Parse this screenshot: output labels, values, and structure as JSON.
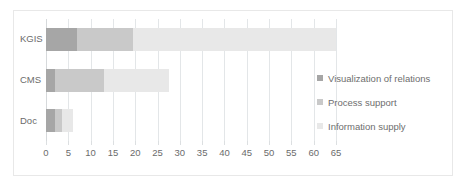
{
  "chart_data": {
    "type": "bar",
    "orientation": "horizontal",
    "stacked": true,
    "title": "",
    "xlabel": "",
    "ylabel": "",
    "categories": [
      "KGIS",
      "CMS",
      "Doc"
    ],
    "series": [
      {
        "name": "Visualization of relations",
        "color": "#a6a6a6",
        "values": [
          7,
          2,
          2
        ]
      },
      {
        "name": "Process support",
        "color": "#c9c9c9",
        "values": [
          12.5,
          11,
          1.5
        ]
      },
      {
        "name": "Information supply",
        "color": "#e8e8e8",
        "values": [
          45.5,
          14.5,
          2.5
        ]
      }
    ],
    "totals": [
      65,
      27.5,
      6
    ],
    "xlim": [
      0,
      65
    ],
    "xticks": [
      0,
      5,
      10,
      15,
      20,
      25,
      30,
      35,
      40,
      45,
      50,
      55,
      60,
      65
    ],
    "xtick_labels": [
      "0",
      "5",
      "10",
      "15",
      "20",
      "25",
      "30",
      "35",
      "40",
      "45",
      "50",
      "55",
      "60",
      "65"
    ],
    "grid": true,
    "legend_position": "right"
  },
  "legend": {
    "items": [
      {
        "label": "Visualization of relations",
        "color": "#a6a6a6"
      },
      {
        "label": "Process support",
        "color": "#c9c9c9"
      },
      {
        "label": "Information supply",
        "color": "#e8e8e8"
      }
    ]
  },
  "colors": {
    "frame_border": "#e8e8e8",
    "gridline": "#e3e6e8",
    "tick": "#dcdfe1",
    "text": "#6b6b6b",
    "background": "#ffffff"
  }
}
